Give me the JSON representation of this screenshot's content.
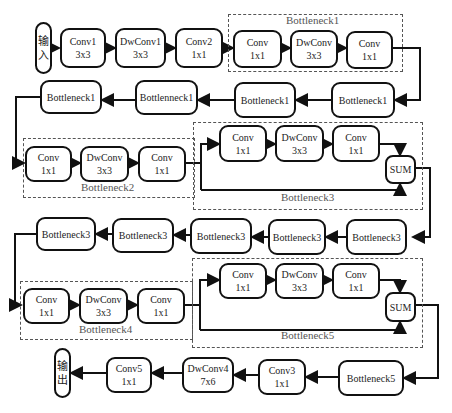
{
  "input_label": [
    "输",
    "入"
  ],
  "output_label": [
    "输",
    "出"
  ],
  "row1": [
    {
      "id": "conv1",
      "line1": "Conv1",
      "line2": "3x3"
    },
    {
      "id": "dwconv1",
      "line1": "DwConv1",
      "line2": "3x3"
    },
    {
      "id": "conv2",
      "line1": "Conv2",
      "line2": "1x1"
    },
    {
      "id": "b1-conv-a",
      "line1": "Conv",
      "line2": "1x1"
    },
    {
      "id": "b1-dwconv",
      "line1": "DwConv",
      "line2": "3x3"
    },
    {
      "id": "b1-conv-b",
      "line1": "Conv",
      "line2": "1x1"
    }
  ],
  "row2": [
    "Bottleneck1",
    "Bottlenneck1",
    "Bottleneck1",
    "Bottleneck1"
  ],
  "row3_b2": [
    {
      "line1": "Conv",
      "line2": "1x1"
    },
    {
      "line1": "DwConv",
      "line2": "3x3"
    },
    {
      "line1": "Conv",
      "line2": "1x1"
    }
  ],
  "row3_b3": [
    {
      "line1": "Conv",
      "line2": "1x1"
    },
    {
      "line1": "DwConv",
      "line2": "3x3"
    },
    {
      "line1": "Conv",
      "line2": "1x1"
    }
  ],
  "row4": [
    "Bottleneck3",
    "Bottleneck3",
    "Bottleneck3",
    "Bottleneck3",
    "Bottleneck3"
  ],
  "row5_b4": [
    {
      "line1": "Conv",
      "line2": "1x1"
    },
    {
      "line1": "DwConv",
      "line2": "3x3"
    },
    {
      "line1": "Conv",
      "line2": "1x1"
    }
  ],
  "row5_b5": [
    {
      "line1": "Conv",
      "line2": "1x1"
    },
    {
      "line1": "DwConv",
      "line2": "3x3"
    },
    {
      "line1": "Conv",
      "line2": "1x1"
    }
  ],
  "row6": [
    {
      "line1": "Conv5",
      "line2": "1x1"
    },
    {
      "line1": "DwConv4",
      "line2": "7x6"
    },
    {
      "line1": "Conv3",
      "line2": "1x1"
    },
    {
      "line1": "Bottleneck5",
      "line2": ""
    }
  ],
  "sum_label": "SUM",
  "groups": {
    "b1": "Bottleneck1",
    "b2": "Bottleneck2",
    "b3": "Bottleneck3",
    "b4": "Bottleneck4",
    "b5": "Bottleneck5"
  }
}
